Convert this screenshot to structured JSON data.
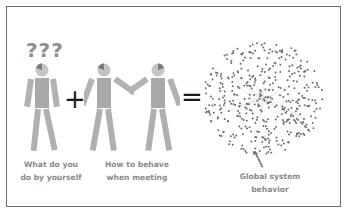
{
  "diagram": {
    "question_marks": "???",
    "plus_sign": "+",
    "equals_sign": "=",
    "captions": {
      "individual": [
        "What do you",
        "do by yourself"
      ],
      "interaction": [
        "How to behave",
        "when meeting"
      ],
      "global": [
        "Global system",
        "behavior"
      ]
    },
    "colors": {
      "figure": "#a9a9a9",
      "figure_head_shade": "#7a7a7a",
      "dots": "#6d6d6d",
      "text": "#8a8a8a",
      "border": "#6e6e6e"
    }
  }
}
